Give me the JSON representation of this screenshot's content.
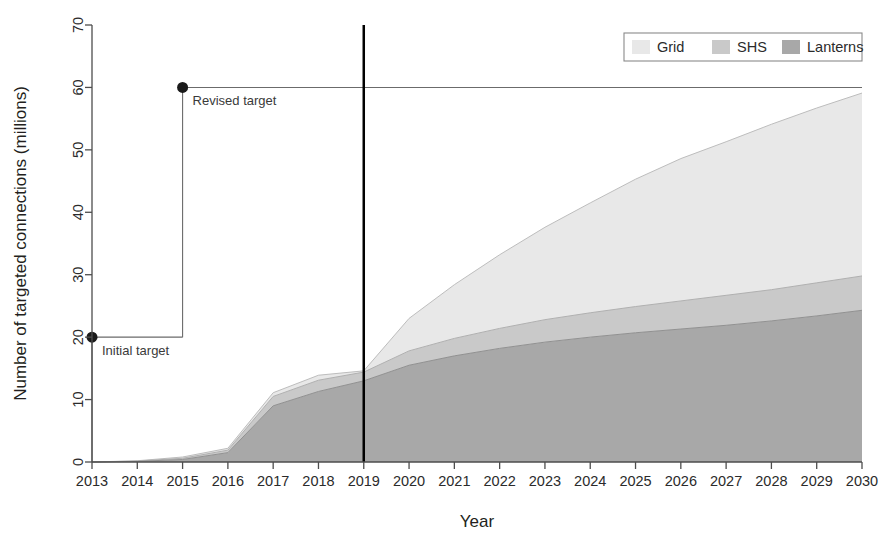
{
  "chart_data": {
    "type": "area",
    "title": "",
    "xlabel": "Year",
    "ylabel": "Number of targeted connections (millions)",
    "xlim": [
      2013,
      2030
    ],
    "ylim": [
      0,
      70
    ],
    "grid": false,
    "stacked": true,
    "legend_position": "top-right",
    "x": [
      2013,
      2014,
      2015,
      2016,
      2017,
      2018,
      2019,
      2020,
      2021,
      2022,
      2023,
      2024,
      2025,
      2026,
      2027,
      2028,
      2029,
      2030
    ],
    "xticklabels": [
      "2013",
      "2014",
      "2015",
      "2016",
      "2017",
      "2018",
      "2019",
      "2020",
      "2021",
      "2022",
      "2023",
      "2024",
      "2025",
      "2026",
      "2027",
      "2028",
      "2029",
      "2030"
    ],
    "yticklabels": [
      "0",
      "10",
      "20",
      "30",
      "40",
      "50",
      "60",
      "70"
    ],
    "yticks": [
      0,
      10,
      20,
      30,
      40,
      50,
      60,
      70
    ],
    "series": [
      {
        "name": "Lanterns",
        "color": "#a8a8a8",
        "values": [
          0.0,
          0.1,
          0.4,
          1.5,
          9.0,
          11.3,
          13.0,
          15.5,
          17.0,
          18.2,
          19.2,
          20.0,
          20.7,
          21.3,
          21.9,
          22.6,
          23.4,
          24.3
        ]
      },
      {
        "name": "SHS",
        "color": "#c9c9c9",
        "values": [
          0.0,
          0.05,
          0.2,
          0.4,
          1.5,
          1.8,
          1.4,
          2.3,
          2.8,
          3.2,
          3.6,
          3.9,
          4.2,
          4.5,
          4.8,
          5.0,
          5.3,
          5.5
        ]
      },
      {
        "name": "Grid",
        "color": "#e8e8e8",
        "values": [
          0.0,
          0.05,
          0.2,
          0.3,
          0.6,
          0.8,
          0.2,
          5.2,
          8.6,
          11.8,
          14.8,
          17.6,
          20.4,
          22.8,
          24.6,
          26.5,
          28.0,
          29.3
        ]
      }
    ],
    "stack_tops": {
      "lanterns": [
        0.0,
        0.1,
        0.4,
        1.5,
        9.0,
        11.3,
        13.0,
        15.5,
        17.0,
        18.2,
        19.2,
        20.0,
        20.7,
        21.3,
        21.9,
        22.6,
        23.4,
        24.3
      ],
      "shs": [
        0.0,
        0.15,
        0.6,
        1.9,
        10.5,
        13.1,
        14.4,
        17.8,
        19.8,
        21.4,
        22.8,
        23.9,
        24.9,
        25.8,
        26.7,
        27.6,
        28.7,
        29.8
      ],
      "grid": [
        0.0,
        0.2,
        0.8,
        2.2,
        11.1,
        13.9,
        14.6,
        23.0,
        28.4,
        33.2,
        37.6,
        41.5,
        45.3,
        48.6,
        51.3,
        54.1,
        56.7,
        59.1
      ]
    },
    "annotations": [
      {
        "id": "initial-target",
        "label": "Initial target",
        "x": 2013,
        "y": 20,
        "marker": "filled-circle",
        "line_to_x": 2015,
        "line_to_y": 20
      },
      {
        "id": "revised-target",
        "label": "Revised target",
        "x": 2015,
        "y": 60,
        "marker": "filled-circle",
        "line_to_x": 2030,
        "line_to_y": 60
      }
    ],
    "reference_line": {
      "id": "current-year-line",
      "x": 2019,
      "color": "#000000",
      "width": 2.5
    },
    "legend": [
      {
        "label": "Grid",
        "color": "#e8e8e8"
      },
      {
        "label": "SHS",
        "color": "#c9c9c9"
      },
      {
        "label": "Lanterns",
        "color": "#a8a8a8"
      }
    ]
  },
  "colors": {
    "axis": "#4d4d4d",
    "text": "#231f20",
    "marker": "#1a1a1a",
    "annotation_line": "#6b6b6b",
    "legend_border": "#8a8a8a",
    "background": "#ffffff"
  }
}
